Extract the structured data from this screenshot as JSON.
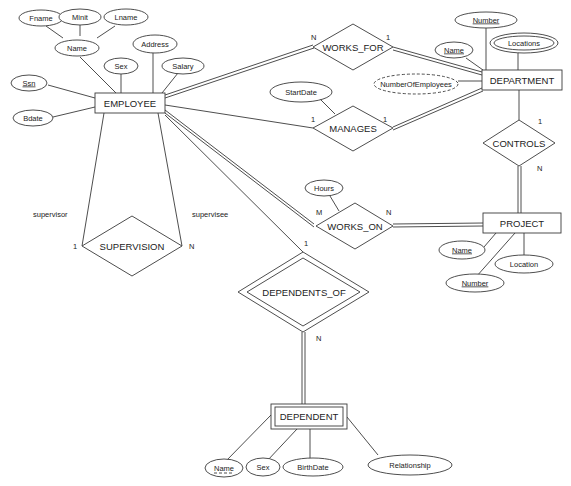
{
  "diagram": {
    "type": "ER diagram",
    "entities": {
      "employee": {
        "label": "EMPLOYEE",
        "weak": false
      },
      "department": {
        "label": "DEPARTMENT",
        "weak": false
      },
      "project": {
        "label": "PROJECT",
        "weak": false
      },
      "dependent": {
        "label": "DEPENDENT",
        "weak": true
      }
    },
    "relationships": {
      "works_for": {
        "label": "WORKS_FOR",
        "identifying": false
      },
      "manages": {
        "label": "MANAGES",
        "identifying": false
      },
      "controls": {
        "label": "CONTROLS",
        "identifying": false
      },
      "works_on": {
        "label": "WORKS_ON",
        "identifying": false
      },
      "supervision": {
        "label": "SUPERVISION",
        "identifying": false
      },
      "dependents_of": {
        "label": "DEPENDENTS_OF",
        "identifying": true
      }
    },
    "attributes": {
      "fname": {
        "label": "Fname"
      },
      "minit": {
        "label": "Minit"
      },
      "lname": {
        "label": "Lname"
      },
      "emp_name": {
        "label": "Name",
        "composite": true
      },
      "ssn": {
        "label": "Ssn",
        "key": true
      },
      "bdate": {
        "label": "Bdate"
      },
      "emp_sex": {
        "label": "Sex"
      },
      "address": {
        "label": "Address"
      },
      "salary": {
        "label": "Salary"
      },
      "dept_number": {
        "label": "Number",
        "key": true
      },
      "dept_name": {
        "label": "Name",
        "key": true
      },
      "locations": {
        "label": "Locations",
        "multivalued": true
      },
      "num_employees": {
        "label": "NumberOfEmployees",
        "derived": true
      },
      "start_date": {
        "label": "StartDate"
      },
      "hours": {
        "label": "Hours"
      },
      "proj_name": {
        "label": "Name",
        "key": true
      },
      "proj_number": {
        "label": "Number",
        "key": true
      },
      "location": {
        "label": "Location"
      },
      "dep_name": {
        "label": "Name",
        "partial_key": true
      },
      "dep_sex": {
        "label": "Sex"
      },
      "birth_date": {
        "label": "BirthDate"
      },
      "relationship": {
        "label": "Relationship"
      }
    },
    "cardinalities": {
      "works_for_emp": "N",
      "works_for_dept": "1",
      "manages_emp": "1",
      "manages_dept": "1",
      "controls_dept": "1",
      "controls_proj": "N",
      "works_on_emp": "M",
      "works_on_proj": "N",
      "supervision_supervisor": "1",
      "supervision_supervisee": "N",
      "dependents_of_emp": "1",
      "dependents_of_dep": "N"
    },
    "roles": {
      "supervisor": "supervisor",
      "supervisee": "supervisee"
    }
  }
}
